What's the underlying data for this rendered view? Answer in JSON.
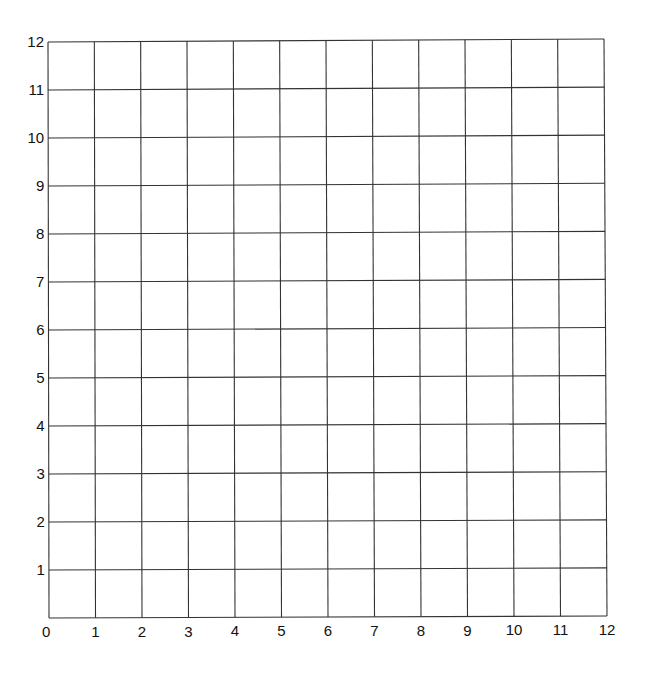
{
  "chart_data": {
    "type": "scatter",
    "title": "",
    "xlabel": "",
    "ylabel": "",
    "xlim": [
      0,
      12
    ],
    "ylim": [
      0,
      12
    ],
    "grid": true,
    "legend": null,
    "x_ticks": [
      0,
      1,
      2,
      3,
      4,
      5,
      6,
      7,
      8,
      9,
      10,
      11,
      12
    ],
    "y_ticks": [
      1,
      2,
      3,
      4,
      5,
      6,
      7,
      8,
      9,
      10,
      11,
      12
    ],
    "x_tick_labels": [
      "0",
      "1",
      "2",
      "3",
      "4",
      "5",
      "6",
      "7",
      "8",
      "9",
      "10",
      "11",
      "12"
    ],
    "y_tick_labels": [
      "1",
      "2",
      "3",
      "4",
      "5",
      "6",
      "7",
      "8",
      "9",
      "10",
      "11",
      "12"
    ],
    "series": []
  },
  "style": {
    "line_color": "#333333",
    "label_color": "#111111",
    "background": "#ffffff"
  }
}
